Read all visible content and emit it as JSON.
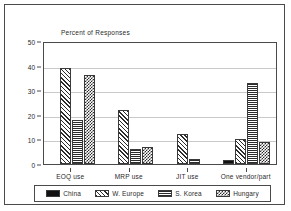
{
  "chart_data": {
    "type": "bar",
    "title": "Percent of Responses",
    "xlabel": "",
    "ylabel": "",
    "ylim": [
      0,
      50
    ],
    "yticks": [
      0,
      10,
      20,
      30,
      40,
      50
    ],
    "grid": true,
    "legend_position": "bottom",
    "categories": [
      "EOQ use",
      "MRP use",
      "JIT use",
      "One vendor/part"
    ],
    "series": [
      {
        "name": "China",
        "pattern": "solid",
        "values": [
          0,
          0,
          0,
          1.5
        ]
      },
      {
        "name": "W. Europe",
        "pattern": "diagonal-hatch",
        "values": [
          39,
          22,
          12,
          10
        ]
      },
      {
        "name": "S. Korea",
        "pattern": "grid-crosshatch",
        "values": [
          18,
          6,
          2,
          33
        ]
      },
      {
        "name": "Hungary",
        "pattern": "checkerboard",
        "values": [
          36,
          7,
          0,
          9
        ]
      }
    ]
  },
  "axes": {
    "y_tick_labels": [
      "0",
      "10",
      "20",
      "30",
      "40",
      "50"
    ],
    "x_tick_labels": [
      "EOQ use",
      "MRP use",
      "JIT use",
      "One vendor/part"
    ]
  },
  "legend": {
    "items": [
      {
        "label": "China"
      },
      {
        "label": "W. Europe"
      },
      {
        "label": "S. Korea"
      },
      {
        "label": "Hungary"
      }
    ]
  },
  "colors": {
    "frame": "#4a4a4a",
    "gridline": "#c9c9c9",
    "ink": "#2a2a2a",
    "pattern_ink": "#2b2b2b",
    "background": "#ffffff"
  }
}
